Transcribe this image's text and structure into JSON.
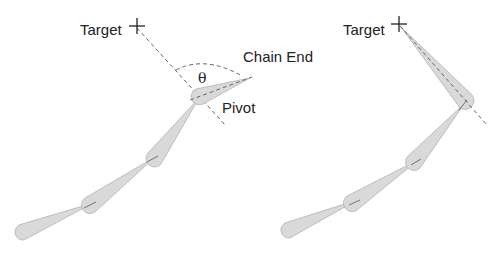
{
  "diagram": {
    "type": "CCD inverse kinematics step illustration",
    "colors": {
      "bone_fill": "#d9d9d9",
      "bone_stroke": "#b3b3b3",
      "dashed_line": "#666666",
      "text": "#222222",
      "background": "#ffffff"
    },
    "left_panel": {
      "labels": {
        "target": "Target",
        "chain_end": "Chain End",
        "pivot": "Pivot",
        "angle": "θ"
      },
      "target_marker": "crosshair",
      "bones": 4
    },
    "right_panel": {
      "labels": {
        "target": "Target"
      },
      "target_marker": "crosshair",
      "bones": 4
    }
  }
}
